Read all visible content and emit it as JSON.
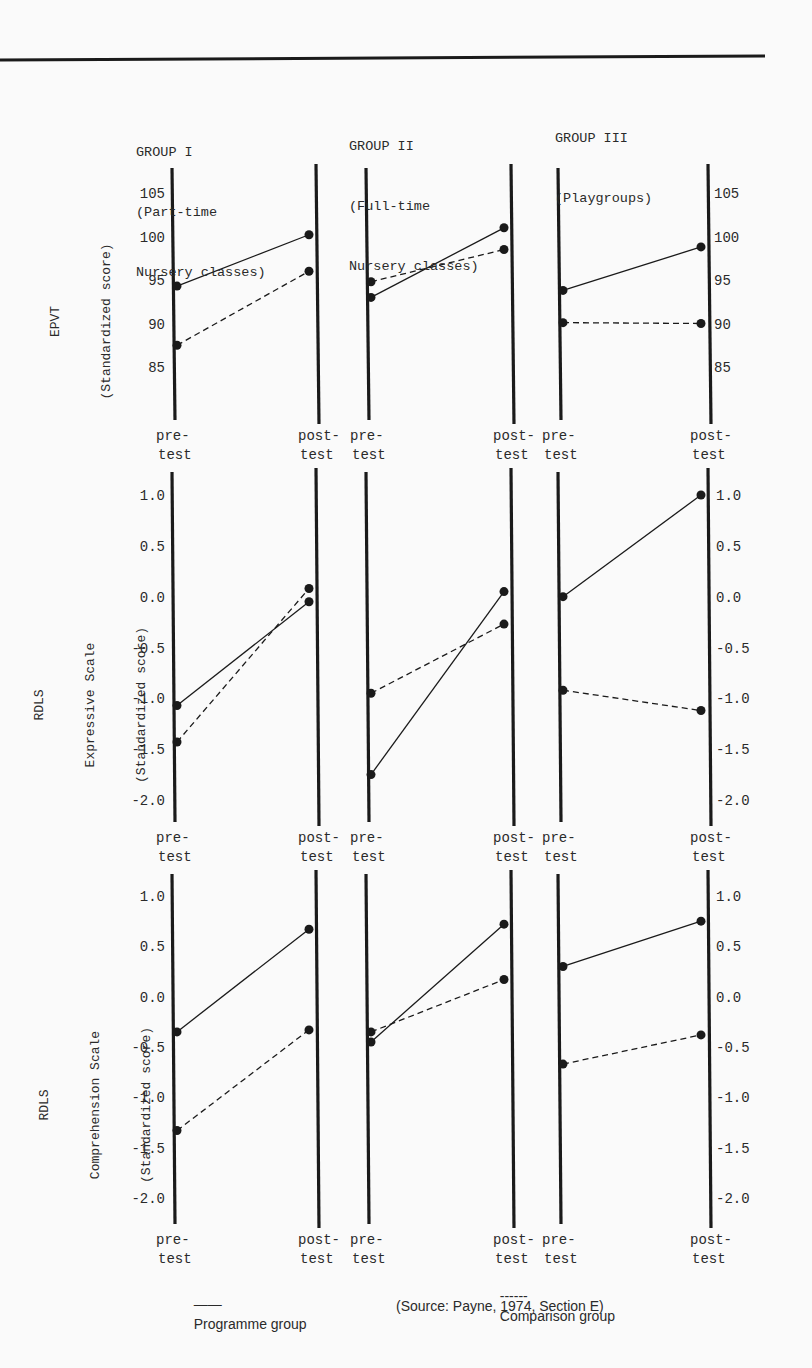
{
  "groups": [
    {
      "title": "GROUP I",
      "subtitle_1": "(Part-time",
      "subtitle_2": "Nursery classes)"
    },
    {
      "title": "GROUP II",
      "subtitle_1": "(Full-time",
      "subtitle_2": "Nursery classes)"
    },
    {
      "title": "GROUP III",
      "subtitle_1": "(Playgroups)",
      "subtitle_2": ""
    }
  ],
  "axis_labels": {
    "pre_1": "pre-",
    "pre_2": "test",
    "post_1": "post-",
    "post_2": "test"
  },
  "panels": [
    {
      "ylabel_1": "EPVT",
      "ylabel_2": "(Standardized score)",
      "ylabel_3": ""
    },
    {
      "ylabel_1": "RDLS",
      "ylabel_2": "Expressive Scale",
      "ylabel_3": "(Standardized score)"
    },
    {
      "ylabel_1": "RDLS",
      "ylabel_2": "Comprehension Scale",
      "ylabel_3": "(Standardized score)"
    }
  ],
  "legend": {
    "programme": "Programme group",
    "comparison": "Comparison group",
    "programme_dash": "——",
    "comparison_dash": "------"
  },
  "source": "(Source: Payne, 1974, Section E)",
  "colors": {
    "ink": "#1a1a1a",
    "paper": "#fafafa"
  },
  "chart_data": [
    {
      "type": "line",
      "title": "EPVT (Standardized score)",
      "ylabel": "EPVT (Standardized score)",
      "yticks": [
        85,
        90,
        95,
        100,
        105
      ],
      "ylim": [
        82,
        108
      ],
      "categories": [
        "pre-test",
        "post-test"
      ],
      "groups": [
        {
          "name": "GROUP I (Part-time Nursery classes)",
          "series": [
            {
              "name": "Programme group",
              "values": [
                94.3,
                100.2
              ]
            },
            {
              "name": "Comparison group",
              "values": [
                87.5,
                96.0
              ]
            }
          ]
        },
        {
          "name": "GROUP II (Full-time Nursery classes)",
          "series": [
            {
              "name": "Programme group",
              "values": [
                93.0,
                101.0
              ]
            },
            {
              "name": "Comparison group",
              "values": [
                94.8,
                98.5
              ]
            }
          ]
        },
        {
          "name": "GROUP III (Playgroups)",
          "series": [
            {
              "name": "Programme group",
              "values": [
                93.8,
                98.8
              ]
            },
            {
              "name": "Comparison group",
              "values": [
                90.1,
                90.0
              ]
            }
          ]
        }
      ]
    },
    {
      "type": "line",
      "title": "RDLS Expressive Scale (Standardized score)",
      "ylabel": "RDLS Expressive Scale (Standardized score)",
      "yticks": [
        -2.0,
        -1.5,
        -1.0,
        -0.5,
        0.0,
        0.5,
        1.0
      ],
      "ylim": [
        -2.2,
        1.25
      ],
      "categories": [
        "pre-test",
        "post-test"
      ],
      "groups": [
        {
          "name": "GROUP I (Part-time Nursery classes)",
          "series": [
            {
              "name": "Programme group",
              "values": [
                -1.07,
                -0.05
              ]
            },
            {
              "name": "Comparison group",
              "values": [
                -1.43,
                0.08
              ]
            }
          ]
        },
        {
          "name": "GROUP II (Full-time Nursery classes)",
          "series": [
            {
              "name": "Programme group",
              "values": [
                -1.75,
                0.05
              ]
            },
            {
              "name": "Comparison group",
              "values": [
                -0.95,
                -0.27
              ]
            }
          ]
        },
        {
          "name": "GROUP III (Playgroups)",
          "series": [
            {
              "name": "Programme group",
              "values": [
                0.0,
                1.0
              ]
            },
            {
              "name": "Comparison group",
              "values": [
                -0.92,
                -1.12
              ]
            }
          ]
        }
      ]
    },
    {
      "type": "line",
      "title": "RDLS Comprehension Scale (Standardized score)",
      "ylabel": "RDLS Comprehension Scale (Standardized score)",
      "yticks": [
        -2.0,
        -1.5,
        -1.0,
        -0.5,
        0.0,
        0.5,
        1.0
      ],
      "ylim": [
        -2.25,
        1.2
      ],
      "categories": [
        "pre-test",
        "post-test"
      ],
      "groups": [
        {
          "name": "GROUP I (Part-time Nursery classes)",
          "series": [
            {
              "name": "Programme group",
              "values": [
                -0.35,
                0.67
              ]
            },
            {
              "name": "Comparison group",
              "values": [
                -1.33,
                -0.33
              ]
            }
          ]
        },
        {
          "name": "GROUP II (Full-time Nursery classes)",
          "series": [
            {
              "name": "Programme group",
              "values": [
                -0.45,
                0.72
              ]
            },
            {
              "name": "Comparison group",
              "values": [
                -0.35,
                0.17
              ]
            }
          ]
        },
        {
          "name": "GROUP III (Playgroups)",
          "series": [
            {
              "name": "Programme group",
              "values": [
                0.3,
                0.75
              ]
            },
            {
              "name": "Comparison group",
              "values": [
                -0.67,
                -0.38
              ]
            }
          ]
        }
      ]
    }
  ]
}
